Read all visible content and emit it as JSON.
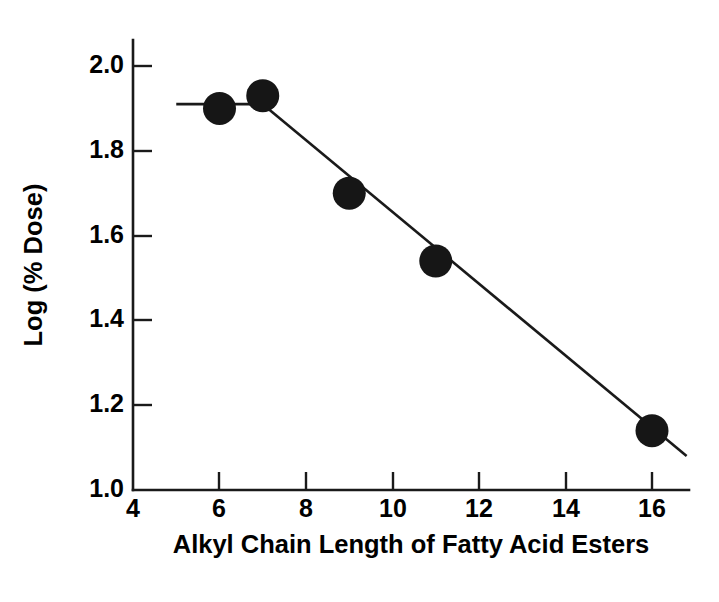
{
  "chart_data": {
    "type": "scatter",
    "title": "",
    "xlabel": "Alkyl Chain Length of Fatty Acid Esters",
    "ylabel": "Log (% Dose)",
    "xlim": [
      4,
      17
    ],
    "ylim": [
      1.0,
      2.05
    ],
    "xticks": [
      4,
      6,
      8,
      10,
      12,
      14,
      16
    ],
    "xtick_labels": [
      "4",
      "6",
      "8",
      "10",
      "12",
      "14",
      "16"
    ],
    "yticks": [
      1.0,
      1.2,
      1.4,
      1.6,
      1.8,
      2.0
    ],
    "ytick_labels": [
      "1.0",
      "1.2",
      "1.4",
      "1.6",
      "1.8",
      "2.0"
    ],
    "grid": false,
    "legend": "none",
    "marker_style": "filled-circle",
    "marker_color": "#161616",
    "line_color": "#1a1a1a",
    "axis_color": "#1a1a1a",
    "tick_direction": "in",
    "series": [
      {
        "name": "Log (% Dose) vs alkyl chain length",
        "x": [
          6,
          7,
          9,
          11,
          16
        ],
        "y": [
          1.9,
          1.93,
          1.7,
          1.54,
          1.14
        ]
      }
    ],
    "fit_lines": [
      {
        "name": "plateau-segment",
        "x": [
          5.0,
          7.0
        ],
        "y": [
          1.91,
          1.91
        ]
      },
      {
        "name": "descending-regression-segment",
        "x": [
          7.0,
          16.8
        ],
        "y": [
          1.91,
          1.08
        ]
      }
    ]
  },
  "axes": {
    "y_label": "Log (% Dose)",
    "x_label": "Alkyl Chain Length of Fatty Acid Esters"
  },
  "x_tick_labels": [
    "4",
    "6",
    "8",
    "10",
    "12",
    "14",
    "16"
  ],
  "y_tick_labels": [
    "1.0",
    "1.2",
    "1.4",
    "1.6",
    "1.8",
    "2.0"
  ]
}
